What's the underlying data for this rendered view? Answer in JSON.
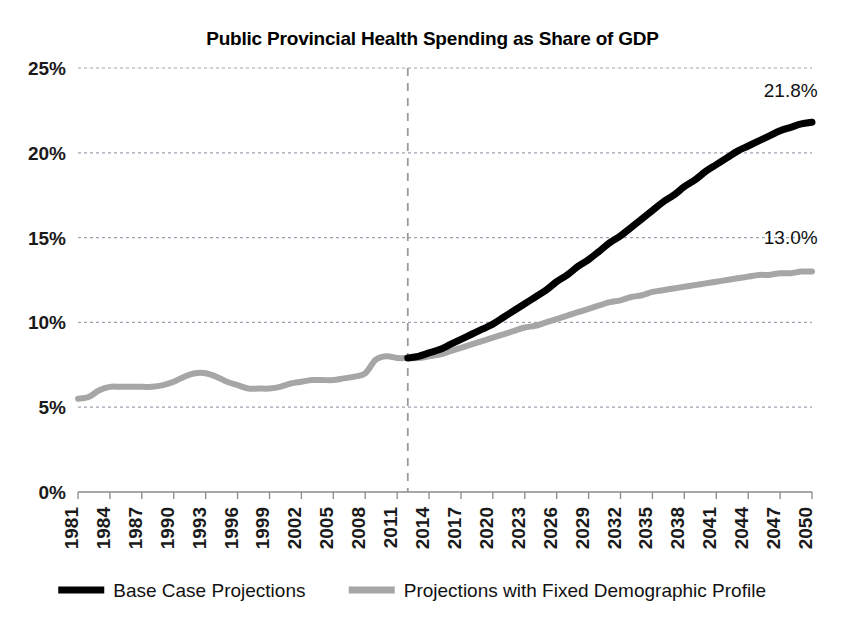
{
  "chart_data": {
    "type": "line",
    "title": "Public Provincial Health Spending as Share of GDP",
    "xlabel": "",
    "ylabel": "",
    "ylim": [
      0,
      25
    ],
    "xlim": [
      1981,
      2050
    ],
    "grid": true,
    "legend_position": "bottom",
    "y_tick_labels": [
      "25%",
      "20%",
      "15%",
      "10%",
      "5%",
      "0%"
    ],
    "y_tick_values": [
      25,
      20,
      15,
      10,
      5,
      0
    ],
    "x_tick_labels": [
      "1981",
      "1984",
      "1987",
      "1990",
      "1993",
      "1996",
      "1999",
      "2002",
      "2005",
      "2008",
      "2011",
      "2014",
      "2017",
      "2020",
      "2023",
      "2026",
      "2029",
      "2032",
      "2035",
      "2038",
      "2041",
      "2044",
      "2047",
      "2050"
    ],
    "x_tick_values": [
      1981,
      1984,
      1987,
      1990,
      1993,
      1996,
      1999,
      2002,
      2005,
      2008,
      2011,
      2014,
      2017,
      2020,
      2023,
      2026,
      2029,
      2032,
      2035,
      2038,
      2041,
      2044,
      2047,
      2050
    ],
    "projection_divider_year": 2012,
    "annotations": [
      {
        "text": "21.8%",
        "x": 2048,
        "y": 23.3,
        "series": "Base Case Projections"
      },
      {
        "text": "13.0%",
        "x": 2048,
        "y": 14.6,
        "series": "Projections with Fixed Demographic Profile"
      }
    ],
    "series": [
      {
        "name": "Projections with Fixed Demographic Profile",
        "color": "#a6a6a6",
        "width": 6,
        "x": [
          1981,
          1982,
          1983,
          1984,
          1985,
          1986,
          1987,
          1988,
          1989,
          1990,
          1991,
          1992,
          1993,
          1994,
          1995,
          1996,
          1997,
          1998,
          1999,
          2000,
          2001,
          2002,
          2003,
          2004,
          2005,
          2006,
          2007,
          2008,
          2009,
          2010,
          2011,
          2012,
          2013,
          2014,
          2015,
          2016,
          2017,
          2018,
          2019,
          2020,
          2021,
          2022,
          2023,
          2024,
          2025,
          2026,
          2027,
          2028,
          2029,
          2030,
          2031,
          2032,
          2033,
          2034,
          2035,
          2036,
          2037,
          2038,
          2039,
          2040,
          2041,
          2042,
          2043,
          2044,
          2045,
          2046,
          2047,
          2048,
          2049,
          2050
        ],
        "values": [
          5.5,
          5.6,
          6.0,
          6.2,
          6.2,
          6.2,
          6.2,
          6.2,
          6.3,
          6.5,
          6.8,
          7.0,
          7.0,
          6.8,
          6.5,
          6.3,
          6.1,
          6.1,
          6.1,
          6.2,
          6.4,
          6.5,
          6.6,
          6.6,
          6.6,
          6.7,
          6.8,
          7.0,
          7.8,
          8.0,
          7.9,
          7.9,
          7.9,
          8.0,
          8.1,
          8.3,
          8.5,
          8.7,
          8.9,
          9.1,
          9.3,
          9.5,
          9.7,
          9.8,
          10.0,
          10.2,
          10.4,
          10.6,
          10.8,
          11.0,
          11.2,
          11.3,
          11.5,
          11.6,
          11.8,
          11.9,
          12.0,
          12.1,
          12.2,
          12.3,
          12.4,
          12.5,
          12.6,
          12.7,
          12.8,
          12.8,
          12.9,
          12.9,
          13.0,
          13.0
        ]
      },
      {
        "name": "Base Case Projections",
        "color": "#000000",
        "width": 7,
        "x": [
          2012,
          2013,
          2014,
          2015,
          2016,
          2017,
          2018,
          2019,
          2020,
          2021,
          2022,
          2023,
          2024,
          2025,
          2026,
          2027,
          2028,
          2029,
          2030,
          2031,
          2032,
          2033,
          2034,
          2035,
          2036,
          2037,
          2038,
          2039,
          2040,
          2041,
          2042,
          2043,
          2044,
          2045,
          2046,
          2047,
          2048,
          2049,
          2050
        ],
        "values": [
          7.9,
          8.0,
          8.2,
          8.4,
          8.7,
          9.0,
          9.3,
          9.6,
          9.9,
          10.3,
          10.7,
          11.1,
          11.5,
          11.9,
          12.4,
          12.8,
          13.3,
          13.7,
          14.2,
          14.7,
          15.1,
          15.6,
          16.1,
          16.6,
          17.1,
          17.5,
          18.0,
          18.4,
          18.9,
          19.3,
          19.7,
          20.1,
          20.4,
          20.7,
          21.0,
          21.3,
          21.5,
          21.7,
          21.8
        ]
      }
    ],
    "legend": [
      {
        "label": "Base Case Projections",
        "color": "#000000"
      },
      {
        "label": "Projections with Fixed Demographic Profile",
        "color": "#a6a6a6"
      }
    ]
  }
}
